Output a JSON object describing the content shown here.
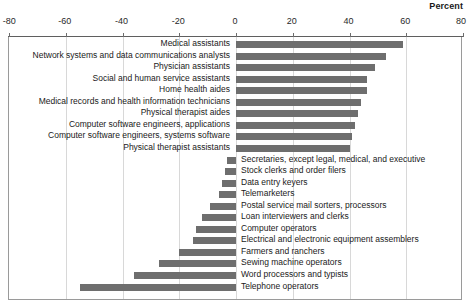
{
  "header": {
    "percent_label": "Percent"
  },
  "chart_data": {
    "type": "bar",
    "title": "",
    "subtitle": "",
    "xlabel": "Percent",
    "ylabel": "",
    "orientation": "horizontal",
    "grid": true,
    "legend": "none",
    "xlim": [
      -80,
      80
    ],
    "xticks": [
      -80,
      -60,
      -40,
      -20,
      0,
      20,
      40,
      60,
      80
    ],
    "xtick_labels": [
      "-80",
      "-60",
      "-40",
      "-20",
      "0",
      "20",
      "40",
      "60",
      "80"
    ],
    "bar_color": "#6e6e6e",
    "categories": [
      "Medical assistants",
      "Network systems and data communications analysts",
      "Physician assistants",
      "Social and human service assistants",
      "Home health aides",
      "Medical records and health information technicians",
      "Physical therapist aides",
      "Computer software engineers, applications",
      "Computer software engineers, systems software",
      "Physical therapist assistants",
      "Secretaries, except legal, medical, and executive",
      "Stock clerks and order filers",
      "Data entry keyers",
      "Telemarketers",
      "Postal service mail sorters, processors",
      "Loan interviewers and clerks",
      "Computer operators",
      "Electrical and electronic equipment assemblers",
      "Farmers and ranchers",
      "Sewing machine operators",
      "Word processors and typists",
      "Telephone operators"
    ],
    "values": [
      59,
      53,
      49,
      46,
      46,
      44,
      43,
      42,
      41,
      40,
      -3,
      -4,
      -5,
      -6,
      -9,
      -12,
      -14,
      -15,
      -20,
      -27,
      -36,
      -55
    ]
  }
}
